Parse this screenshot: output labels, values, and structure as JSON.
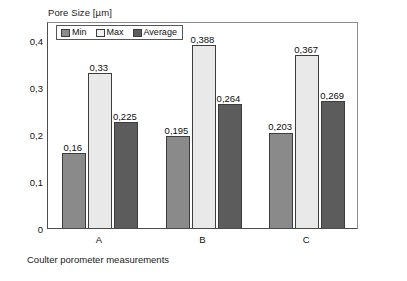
{
  "chart_data": {
    "type": "bar",
    "title": "Pore Size [µm]",
    "xlabel": "",
    "ylabel": "Pore Size [µm]",
    "categories": [
      "A",
      "B",
      "C"
    ],
    "series": [
      {
        "name": "Min",
        "values": [
          0.16,
          0.195,
          0.203
        ],
        "labels": [
          "0,16",
          "0,195",
          "0,203"
        ],
        "color": "#8a8a8a"
      },
      {
        "name": "Max",
        "values": [
          0.33,
          0.388,
          0.367
        ],
        "labels": [
          "0,33",
          "0,388",
          "0,367"
        ],
        "color": "#e9e9e9"
      },
      {
        "name": "Average",
        "values": [
          0.225,
          0.264,
          0.269
        ],
        "labels": [
          "0,225",
          "0,264",
          "0,269"
        ],
        "color": "#5c5c5c"
      }
    ],
    "ylim": [
      0,
      0.44
    ],
    "ytick_values": [
      0,
      0.1,
      0.2,
      0.3,
      0.4
    ],
    "ytick_labels": [
      "0",
      "0,1",
      "0,2",
      "0,3",
      "0,4"
    ],
    "grid": false,
    "legend_position": "top-left",
    "caption": "Coulter porometer measurements",
    "decimal_separator": ","
  },
  "legend": {
    "items": [
      {
        "label": "Min"
      },
      {
        "label": "Max"
      },
      {
        "label": "Average"
      }
    ]
  }
}
